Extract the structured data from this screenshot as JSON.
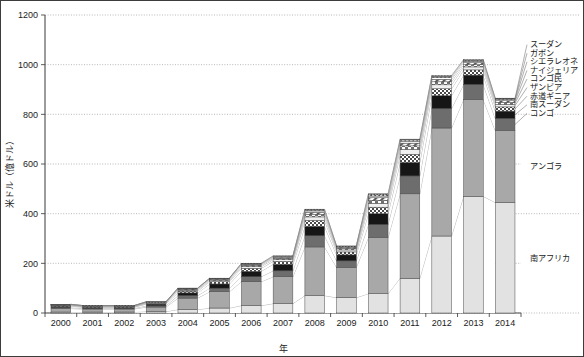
{
  "chart_data": {
    "type": "bar",
    "stacked": true,
    "title": "",
    "subtitle": "",
    "xlabel": "年",
    "ylabel": "米ドル（億ドル）",
    "ylim": [
      0,
      1200
    ],
    "ytick_step": 200,
    "ytick_labels": [
      "0",
      "200",
      "400",
      "600",
      "800",
      "1000",
      "1200"
    ],
    "grid": true,
    "grid_axis": "y",
    "legend_position": "right",
    "categories": [
      "2000",
      "2001",
      "2002",
      "2003",
      "2004",
      "2005",
      "2006",
      "2007",
      "2008",
      "2009",
      "2010",
      "2011",
      "2012",
      "2013",
      "2014"
    ],
    "series": [
      {
        "name": "南アフリカ",
        "fill": "light-gray-solid",
        "color": "#e2e2e2",
        "values": [
          4,
          4,
          4,
          6,
          14,
          20,
          30,
          38,
          70,
          62,
          78,
          140,
          310,
          470,
          445
        ]
      },
      {
        "name": "アンゴラ",
        "fill": "medium-gray-solid",
        "color": "#a8a8a8",
        "values": [
          14,
          12,
          12,
          18,
          46,
          66,
          96,
          108,
          196,
          122,
          226,
          340,
          435,
          390,
          290
        ]
      },
      {
        "name": "コンゴ",
        "fill": "dark-gray-solid",
        "color": "#6d6d6d",
        "values": [
          4,
          3,
          3,
          5,
          10,
          14,
          20,
          24,
          45,
          26,
          52,
          72,
          78,
          60,
          48
        ]
      },
      {
        "name": "南スーダン",
        "fill": "black-solid",
        "color": "#161616",
        "values": [
          5,
          4,
          4,
          7,
          11,
          17,
          22,
          26,
          38,
          24,
          44,
          54,
          52,
          38,
          30
        ]
      },
      {
        "name": "赤道ギニア",
        "fill": "checker-dense",
        "color": "#cfcfcf",
        "values": [
          3,
          2,
          2,
          3,
          7,
          9,
          12,
          12,
          24,
          12,
          26,
          33,
          28,
          21,
          17
        ]
      },
      {
        "name": "ザンビア",
        "fill": "light-gray-solid-2",
        "color": "#efefef",
        "values": [
          2,
          2,
          2,
          2,
          4,
          5,
          7,
          7,
          14,
          8,
          16,
          20,
          16,
          12,
          10
        ]
      },
      {
        "name": "コンゴ民",
        "fill": "checker-coarse",
        "color": "#d8d8d8",
        "values": [
          1,
          1,
          1,
          2,
          3,
          4,
          5,
          5,
          10,
          6,
          12,
          14,
          12,
          9,
          8
        ]
      },
      {
        "name": "ナイジェリア",
        "fill": "diagonal-hatch",
        "color": "#c4c4c4",
        "values": [
          1,
          1,
          1,
          1,
          2,
          3,
          4,
          4,
          8,
          5,
          10,
          11,
          10,
          8,
          7
        ]
      },
      {
        "name": "シエラレオネ",
        "fill": "white-solid",
        "color": "#ffffff",
        "values": [
          1,
          1,
          1,
          1,
          2,
          2,
          2,
          3,
          6,
          3,
          7,
          8,
          7,
          6,
          5
        ]
      },
      {
        "name": "ガボン",
        "fill": "dot-grid",
        "color": "#e6e6e6",
        "values": [
          0,
          0,
          0,
          0,
          1,
          0,
          1,
          2,
          4,
          1,
          5,
          5,
          5,
          4,
          3
        ]
      },
      {
        "name": "スーダン",
        "fill": "checker-fine",
        "color": "#dcdcdc",
        "values": [
          0,
          0,
          0,
          0,
          0,
          0,
          1,
          1,
          3,
          1,
          4,
          3,
          3,
          2,
          2
        ]
      }
    ],
    "totals": [
      35,
      30,
      30,
      45,
      100,
      140,
      200,
      230,
      420,
      270,
      480,
      700,
      956,
      1020,
      865
    ],
    "legend_entries": [
      "スーダン",
      "ガボン",
      "シエラレオネ",
      "ナイジェリア",
      "コンゴ民",
      "ザンビア",
      "赤道ギニア",
      "南スーダン",
      "コンゴ"
    ],
    "inline_labels": [
      "アンゴラ",
      "南アフリカ"
    ]
  },
  "axes": {
    "y_title": "米ドル（億ドル）",
    "x_title": "年"
  }
}
